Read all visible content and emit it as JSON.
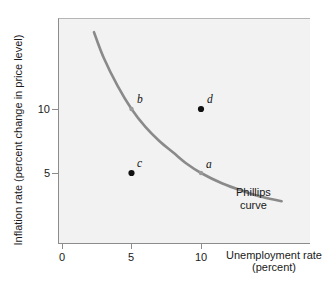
{
  "figure": {
    "caption_fragment": "",
    "background": "#ffffff",
    "plot_background": "#f2f2f2",
    "axis_color": "#8c8c8c",
    "curve_color": "#8a8a8a",
    "point_color": "#111111",
    "curve_point_color": "#9a9a9a"
  },
  "chart_data": {
    "type": "line",
    "title": "",
    "xlabel": "Unemployment rate",
    "xlabel_sub": "(percent)",
    "ylabel": "Inflation rate (percent change in price level)",
    "xlim": [
      0,
      18
    ],
    "ylim": [
      0,
      17.6
    ],
    "xticks": [
      0,
      5,
      10
    ],
    "xticklabels": [
      "0",
      "5",
      "10"
    ],
    "yticks": [
      5,
      10
    ],
    "yticklabels": [
      "5",
      "10"
    ],
    "grid": false,
    "legend": "none",
    "series": [
      {
        "name": "Phillips curve",
        "annotation": "Phillips curve",
        "annotation_line1": "Phillips",
        "annotation_line2": "curve",
        "x": [
          2.3,
          3.0,
          4.0,
          5.0,
          6.0,
          7.0,
          8.0,
          9.0,
          10.0,
          11.5,
          13.0,
          14.5,
          15.8
        ],
        "y": [
          16.0,
          14.0,
          11.8,
          10.0,
          8.6,
          7.5,
          6.6,
          5.7,
          5.0,
          4.2,
          3.6,
          3.1,
          2.8
        ]
      }
    ],
    "points": [
      {
        "id": "a",
        "label": "a",
        "x": 10,
        "y": 5,
        "on_curve": true,
        "label_pos": "above-right"
      },
      {
        "id": "b",
        "label": "b",
        "x": 5,
        "y": 10,
        "on_curve": true,
        "label_pos": "above-right"
      },
      {
        "id": "c",
        "label": "c",
        "x": 5,
        "y": 5,
        "on_curve": false,
        "label_pos": "above-right"
      },
      {
        "id": "d",
        "label": "d",
        "x": 10,
        "y": 10,
        "on_curve": false,
        "label_pos": "above-right"
      }
    ]
  }
}
